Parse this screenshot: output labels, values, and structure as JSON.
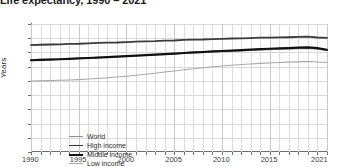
{
  "chart_title": "Life expectancy, 1990 – 2021",
  "axis": {
    "ylabel": "Years",
    "yticks": [
      "0",
      "10",
      "20",
      "30",
      "40",
      "50",
      "60",
      "70",
      "80",
      "90"
    ],
    "xticks": [
      "1990",
      "1995",
      "2000",
      "2005",
      "2010",
      "2015",
      "2021"
    ]
  },
  "legend": {
    "items": [
      {
        "label": "World",
        "color": "#8c8c8c",
        "width": 1.1
      },
      {
        "label": "High income",
        "color": "#3a3a3a",
        "width": 1.8
      },
      {
        "label": "Middle income",
        "color": "#111111",
        "width": 2.2
      },
      {
        "label": "Low income",
        "color": "#a8a8a8",
        "width": 1.1
      }
    ]
  },
  "colors": {
    "background": "#ffffff",
    "grid": "#dcdcdc",
    "grid_major": "#c9c9c9",
    "axis": "#6e6e6e",
    "text": "#3d3d3d",
    "title": "#1b1b1b"
  },
  "chart_data": {
    "type": "line",
    "title": "Life expectancy, 1990 – 2021",
    "xlabel": "",
    "ylabel": "Years",
    "xlim": [
      1990,
      2021
    ],
    "ylim": [
      0,
      90
    ],
    "ytick_step": 10,
    "grid": true,
    "legend_position": "inside-bottom-left",
    "x": [
      1990,
      1991,
      1992,
      1993,
      1994,
      1995,
      1996,
      1997,
      1998,
      1999,
      2000,
      2001,
      2002,
      2003,
      2004,
      2005,
      2006,
      2007,
      2008,
      2009,
      2010,
      2011,
      2012,
      2013,
      2014,
      2015,
      2016,
      2017,
      2018,
      2019,
      2020,
      2021
    ],
    "series": [
      {
        "name": "World",
        "color": "#8c8c8c",
        "values": [
          64.9,
          65.1,
          65.3,
          65.4,
          65.6,
          65.9,
          66.2,
          66.5,
          66.7,
          66.9,
          67.3,
          67.6,
          67.9,
          68.2,
          68.6,
          68.9,
          69.3,
          69.6,
          69.9,
          70.2,
          70.5,
          70.8,
          71.1,
          71.4,
          71.7,
          71.9,
          72.2,
          72.4,
          72.6,
          72.8,
          72.2,
          71.3
        ]
      },
      {
        "name": "High income",
        "color": "#3a3a3a",
        "values": [
          75.2,
          75.4,
          75.6,
          75.7,
          76.0,
          76.1,
          76.4,
          76.7,
          76.9,
          77.0,
          77.3,
          77.6,
          77.8,
          77.9,
          78.3,
          78.4,
          78.8,
          79.0,
          79.1,
          79.4,
          79.6,
          79.8,
          79.9,
          80.1,
          80.4,
          80.4,
          80.6,
          80.7,
          80.9,
          81.1,
          80.5,
          80.3
        ]
      },
      {
        "name": "Middle income",
        "color": "#111111",
        "values": [
          64.5,
          64.8,
          65.0,
          65.2,
          65.5,
          65.8,
          66.1,
          66.4,
          66.7,
          67.0,
          67.4,
          67.7,
          68.1,
          68.4,
          68.8,
          69.2,
          69.6,
          70.0,
          70.3,
          70.7,
          71.0,
          71.3,
          71.7,
          72.0,
          72.3,
          72.6,
          72.9,
          73.1,
          73.4,
          73.6,
          73.0,
          71.9
        ]
      },
      {
        "name": "Low income",
        "color": "#a8a8a8",
        "values": [
          49.8,
          50.0,
          50.2,
          50.4,
          50.6,
          50.9,
          51.3,
          51.7,
          52.2,
          52.7,
          53.3,
          54.0,
          54.7,
          55.4,
          56.2,
          57.0,
          57.8,
          58.5,
          59.2,
          59.9,
          60.5,
          61.0,
          61.5,
          61.9,
          62.3,
          62.6,
          62.9,
          63.2,
          63.4,
          63.7,
          63.3,
          62.9
        ]
      }
    ]
  }
}
